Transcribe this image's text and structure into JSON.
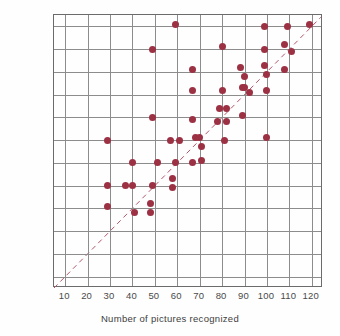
{
  "chart_data": {
    "type": "scatter",
    "title": "",
    "xlabel": "Number of pictures recognized",
    "ylabel": "Number of words recalled",
    "xlim": [
      5,
      125
    ],
    "ylim": [
      5,
      125
    ],
    "xticks": [
      10,
      20,
      30,
      40,
      50,
      60,
      70,
      80,
      90,
      100,
      110,
      120
    ],
    "yticks": [
      10,
      20,
      30,
      40,
      50,
      60,
      70,
      80,
      90,
      100,
      110,
      120
    ],
    "grid": true,
    "legend": "none",
    "point_color": "#9c3144",
    "grid_color": "#8c8c8c",
    "axis_color": "#6b6b6b",
    "trendline": {
      "style": "dashed",
      "color": "#b3566a",
      "description": "identity reference line y = x",
      "x_start": 5,
      "y_start": 5,
      "x_end": 124,
      "y_end": 124
    },
    "points": [
      {
        "x": 29,
        "y": 70
      },
      {
        "x": 29,
        "y": 50
      },
      {
        "x": 29,
        "y": 41
      },
      {
        "x": 37,
        "y": 50
      },
      {
        "x": 40,
        "y": 50
      },
      {
        "x": 40,
        "y": 60
      },
      {
        "x": 41,
        "y": 38
      },
      {
        "x": 48,
        "y": 42
      },
      {
        "x": 48,
        "y": 38
      },
      {
        "x": 49,
        "y": 80
      },
      {
        "x": 49,
        "y": 110
      },
      {
        "x": 49,
        "y": 50
      },
      {
        "x": 51,
        "y": 60
      },
      {
        "x": 57,
        "y": 70
      },
      {
        "x": 58,
        "y": 53
      },
      {
        "x": 58,
        "y": 49
      },
      {
        "x": 59,
        "y": 60
      },
      {
        "x": 59,
        "y": 121
      },
      {
        "x": 61,
        "y": 70
      },
      {
        "x": 67,
        "y": 101
      },
      {
        "x": 67,
        "y": 92
      },
      {
        "x": 67,
        "y": 79
      },
      {
        "x": 67,
        "y": 60
      },
      {
        "x": 68,
        "y": 71
      },
      {
        "x": 70,
        "y": 71
      },
      {
        "x": 71,
        "y": 67
      },
      {
        "x": 71,
        "y": 61
      },
      {
        "x": 78,
        "y": 78
      },
      {
        "x": 79,
        "y": 84
      },
      {
        "x": 80,
        "y": 92
      },
      {
        "x": 80,
        "y": 111
      },
      {
        "x": 81,
        "y": 70
      },
      {
        "x": 82,
        "y": 84
      },
      {
        "x": 82,
        "y": 78
      },
      {
        "x": 88,
        "y": 102
      },
      {
        "x": 89,
        "y": 93
      },
      {
        "x": 89,
        "y": 81
      },
      {
        "x": 90,
        "y": 98
      },
      {
        "x": 90,
        "y": 93
      },
      {
        "x": 92,
        "y": 91
      },
      {
        "x": 99,
        "y": 120
      },
      {
        "x": 99,
        "y": 110
      },
      {
        "x": 99,
        "y": 103
      },
      {
        "x": 100,
        "y": 99
      },
      {
        "x": 100,
        "y": 92
      },
      {
        "x": 100,
        "y": 71
      },
      {
        "x": 108,
        "y": 112
      },
      {
        "x": 108,
        "y": 101
      },
      {
        "x": 109,
        "y": 120
      },
      {
        "x": 111,
        "y": 109
      },
      {
        "x": 119,
        "y": 121
      }
    ]
  }
}
